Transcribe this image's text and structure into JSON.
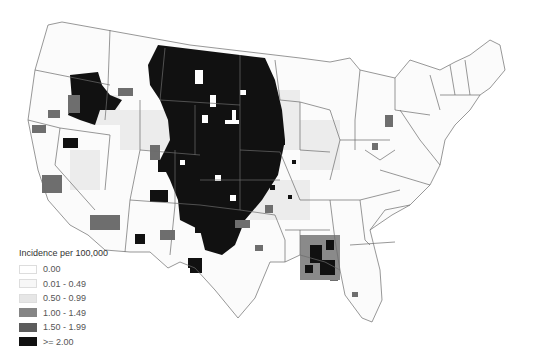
{
  "map": {
    "title": "",
    "region": "Contiguous United States (county-level)",
    "legend": {
      "title": "Incidence per 100,000",
      "classes": [
        {
          "label": "0.00",
          "color": "#ffffff"
        },
        {
          "label": "0.01 - 0.49",
          "color": "#f7f7f7"
        },
        {
          "label": "0.50 - 0.99",
          "color": "#e6e6e6"
        },
        {
          "label": "1.00 - 1.49",
          "color": "#858585"
        },
        {
          "label": "1.50 - 1.99",
          "color": "#5c5c5c"
        },
        {
          "label": ">= 2.00",
          "color": "#111111"
        }
      ]
    },
    "colors": {
      "state_border": "#6b6b6b",
      "background": "#ffffff"
    }
  }
}
